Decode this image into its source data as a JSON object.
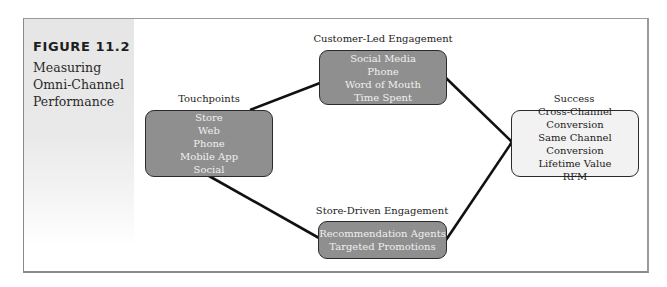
{
  "figure": {
    "number": "FIGURE 11.2",
    "title_lines": [
      "Measuring",
      "Omni-Channel",
      "Performance"
    ]
  },
  "nodes": {
    "touchpoints": {
      "label": "Touchpoints",
      "items": [
        "Store",
        "Web",
        "Phone",
        "Mobile App",
        "Social"
      ]
    },
    "customer_led": {
      "label": "Customer-Led Engagement",
      "items": [
        "Social Media",
        "Phone",
        "Word of Mouth",
        "Time Spent"
      ]
    },
    "store_driven": {
      "label": "Store-Driven Engagement",
      "items": [
        "Recommendation Agents",
        "Targeted Promotions"
      ]
    },
    "success": {
      "label": "Success",
      "items": [
        "Cross-Channel",
        "Conversion",
        "Same Channel Conversion",
        "Lifetime Value",
        "RFM"
      ]
    }
  },
  "edges": [
    {
      "from": "touchpoints",
      "to": "customer_led"
    },
    {
      "from": "touchpoints",
      "to": "store_driven"
    },
    {
      "from": "customer_led",
      "to": "success"
    },
    {
      "from": "store_driven",
      "to": "success"
    }
  ],
  "colors": {
    "dark_node_fill": "#8f8f8f",
    "light_node_fill": "#f2f2f2",
    "connector": "#111111"
  }
}
